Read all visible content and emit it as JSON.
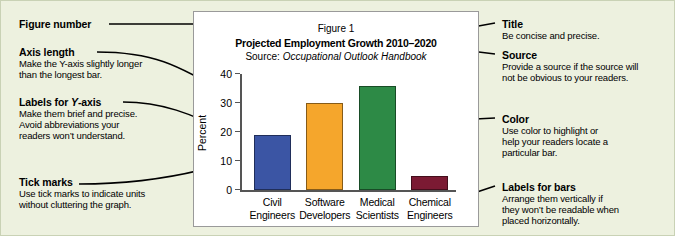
{
  "colors": {
    "background": "#edf1df",
    "panel": "#ffffff",
    "panel_border": "#9a9a9a",
    "leader": "#000000",
    "axis": "#555555"
  },
  "chart_panel": {
    "figure_number": "Figure 1",
    "title": "Projected Employment Growth 2010–2020",
    "source_prefix": "Source: ",
    "source_name": "Occupational Outlook Handbook"
  },
  "chart_data": {
    "type": "bar",
    "title": "Projected Employment Growth 2010–2020",
    "subtitle": "Source: Occupational Outlook Handbook",
    "figure_number": "Figure 1",
    "categories": [
      "Civil Engineers",
      "Software Developers",
      "Medical Scientists",
      "Chemical Engineers"
    ],
    "category_lines": [
      [
        "Civil",
        "Engineers"
      ],
      [
        "Software",
        "Developers"
      ],
      [
        "Medical",
        "Scientists"
      ],
      [
        "Chemical",
        "Engineers"
      ]
    ],
    "values": [
      19,
      30,
      36,
      5
    ],
    "bar_colors": [
      "#3b55a4",
      "#f5a62c",
      "#2d8a46",
      "#7b1a33"
    ],
    "xlabel": "",
    "ylabel": "Percent",
    "ylim": [
      0,
      40
    ],
    "yticks": [
      0,
      10,
      20,
      30,
      40
    ],
    "ytick_labels": [
      "0",
      "10",
      "20",
      "30",
      "40"
    ],
    "grid": false,
    "legend": "none"
  },
  "annotations": {
    "figure_number": {
      "heading": "Figure number",
      "body": ""
    },
    "axis_length": {
      "heading": "Axis length",
      "body": "Make the Y-axis slightly longer than the longest bar.",
      "body_lines": [
        "Make the Y-axis slightly longer",
        "than the longest bar."
      ]
    },
    "y_labels": {
      "heading_plain": "Labels for ",
      "heading_italic": "Y",
      "heading_tail": "-axis",
      "body_lines": [
        "Make them brief and precise.",
        "Avoid abbreviations your",
        "readers won’t understand."
      ]
    },
    "tick_marks": {
      "heading": "Tick marks",
      "body_lines": [
        "Use tick marks to indicate units",
        "without cluttering the graph."
      ]
    },
    "title": {
      "heading": "Title",
      "body_lines": [
        "Be concise and precise."
      ]
    },
    "source": {
      "heading": "Source",
      "body_lines": [
        "Provide a source if the source will",
        "not be obvious to your readers."
      ]
    },
    "color": {
      "heading": "Color",
      "body_lines": [
        "Use color to highlight or",
        "help your readers locate a",
        "particular bar."
      ]
    },
    "labels_for_bars": {
      "heading": "Labels for bars",
      "body_lines": [
        "Arrange them vertically if",
        "they won’t be readable when",
        "placed horizontally."
      ]
    }
  }
}
